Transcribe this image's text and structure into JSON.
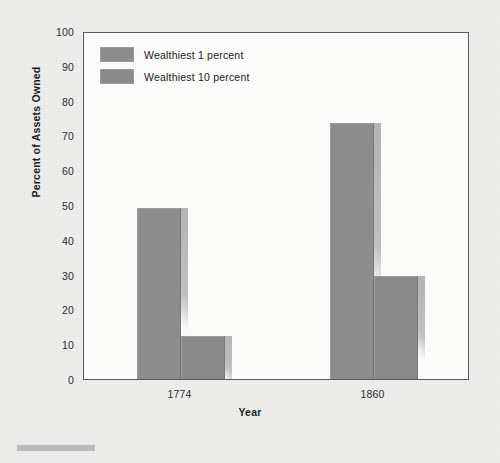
{
  "chart_data": {
    "type": "bar",
    "title": "",
    "subtitle": "",
    "xlabel": "Year",
    "ylabel": "Percent of Assets Owned",
    "categories": [
      "1774",
      "1860"
    ],
    "series": [
      {
        "name": "Wealthiest 1 percent",
        "values": [
          49,
          73.5
        ],
        "color": "#8d8d8d"
      },
      {
        "name": "Wealthiest 10 percent",
        "values": [
          12.5,
          29.5
        ],
        "color": "#8a8a8a"
      }
    ],
    "ylim": [
      0,
      100
    ],
    "yticks": [
      0,
      10,
      20,
      30,
      40,
      50,
      60,
      70,
      80,
      90,
      100
    ],
    "ytick_labels": [
      "0",
      "10",
      "20",
      "30",
      "40",
      "50",
      "60",
      "70",
      "80",
      "90",
      "100"
    ],
    "grid": false,
    "legend_position": "top-left-inside",
    "bar_style": "shadowed-3d"
  },
  "legend": {
    "entries": [
      {
        "label": "Wealthiest 1 percent"
      },
      {
        "label": "Wealthiest 10 percent"
      }
    ]
  },
  "axes": {
    "x_title": "Year",
    "y_title": "Percent of Assets Owned"
  }
}
